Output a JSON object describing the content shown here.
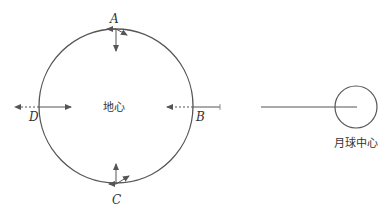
{
  "diagram": {
    "earth": {
      "label": "地心",
      "cx": 116,
      "cy": 106,
      "r": 77
    },
    "moon": {
      "label": "月球中心",
      "cx": 356,
      "cy": 107,
      "r": 21
    },
    "points": {
      "A": {
        "label": "A"
      },
      "B": {
        "label": "B"
      },
      "C": {
        "label": "C"
      },
      "D": {
        "label": "D"
      }
    },
    "colors": {
      "stroke": "#555555",
      "text": "#333333"
    }
  }
}
